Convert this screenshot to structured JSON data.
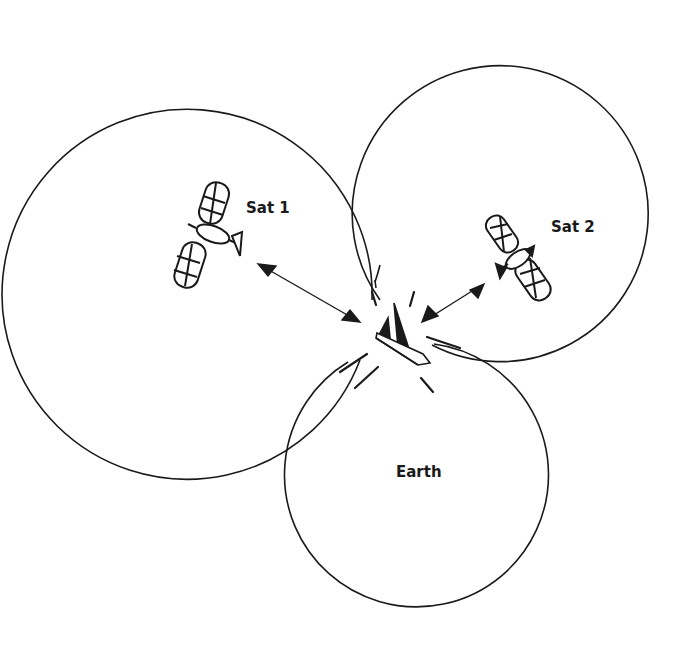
{
  "diagram": {
    "labels": {
      "sat1": "Sat 1",
      "sat2": "Sat 2",
      "earth": "Earth"
    },
    "circles": [
      {
        "name": "sat1-range",
        "cx": 228,
        "cy": 255,
        "r": 185
      },
      {
        "name": "sat2-range",
        "cx": 515,
        "cy": 275,
        "r": 148
      },
      {
        "name": "earth",
        "cx": 415,
        "cy": 475,
        "r": 132
      }
    ],
    "stroke_color": "#1a1a1a"
  }
}
